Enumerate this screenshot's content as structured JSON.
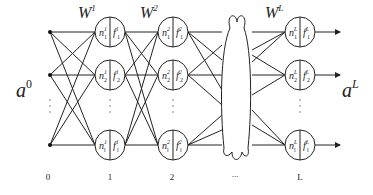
{
  "diagram": {
    "type": "multilayer-neural-network",
    "input_label": "a",
    "input_label_sup": "0",
    "output_label": "a",
    "output_label_sup": "L",
    "weights": [
      {
        "base": "W",
        "sup": "1"
      },
      {
        "base": "W",
        "sup": "2"
      },
      {
        "base": "W",
        "sup": "L"
      }
    ],
    "layer_indices": [
      "0",
      "1",
      "2",
      "...",
      "L"
    ],
    "ellipsis_vertical": "⋮",
    "layers": [
      {
        "index": "1",
        "neurons": [
          {
            "n": "n",
            "n_sub": "1",
            "n_sup": "1",
            "f": "f",
            "f_sub": "1",
            "f_sup": "1"
          },
          {
            "n": "n",
            "n_sub": "2",
            "n_sup": "1",
            "f": "f",
            "f_sub": "2",
            "f_sup": "1"
          },
          {
            "n": "n",
            "n_sub": "l",
            "n_sup": "1",
            "f": "f",
            "f_sub": "l",
            "f_sup": "1"
          }
        ]
      },
      {
        "index": "2",
        "neurons": [
          {
            "n": "n",
            "n_sub": "1",
            "n_sup": "2",
            "f": "f",
            "f_sub": "1",
            "f_sup": "2"
          },
          {
            "n": "n",
            "n_sub": "2",
            "n_sup": "2",
            "f": "f",
            "f_sub": "2",
            "f_sup": "2"
          },
          {
            "n": "n",
            "n_sub": "l",
            "n_sup": "2",
            "f": "f",
            "f_sub": "l",
            "f_sup": "2"
          }
        ]
      },
      {
        "index": "L",
        "neurons": [
          {
            "n": "n",
            "n_sub": "1",
            "n_sup": "L",
            "f": "f",
            "f_sub": "1",
            "f_sup": "L"
          },
          {
            "n": "n",
            "n_sub": "2",
            "n_sup": "L",
            "f": "f",
            "f_sub": "2",
            "f_sup": "L"
          },
          {
            "n": "n",
            "n_sub": "l",
            "n_sup": "L",
            "f": "f",
            "f_sub": "l",
            "f_sup": "L"
          }
        ]
      }
    ],
    "colors": {
      "stroke": "#222222",
      "background": "#ffffff"
    }
  }
}
